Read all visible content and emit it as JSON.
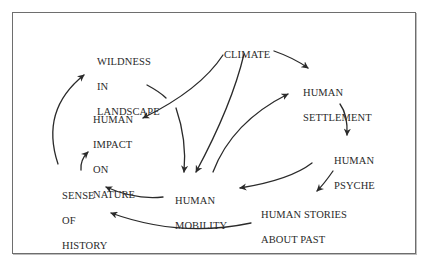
{
  "diagram": {
    "nodes": {
      "climate": {
        "lines": [
          "CLIMATE"
        ]
      },
      "wildness": {
        "lines": [
          "WILDNESS",
          "IN",
          "LANDSCAPE"
        ]
      },
      "settlement": {
        "lines": [
          "HUMAN",
          "SETTLEMENT"
        ]
      },
      "impact": {
        "lines": [
          "HUMAN",
          "IMPACT",
          "ON",
          "NATURE"
        ]
      },
      "psyche": {
        "lines": [
          "HUMAN",
          "PSYCHE"
        ]
      },
      "history": {
        "lines": [
          "SENSE",
          "OF",
          "HISTORY"
        ]
      },
      "mobility": {
        "lines": [
          "HUMAN",
          "MOBILITY"
        ]
      },
      "stories": {
        "lines": [
          "HUMAN STORIES",
          "ABOUT PAST"
        ]
      }
    },
    "edges": [
      {
        "from": "CLIMATE",
        "to": "HUMAN SETTLEMENT"
      },
      {
        "from": "CLIMATE",
        "to": "HUMAN IMPACT ON NATURE"
      },
      {
        "from": "CLIMATE",
        "to": "HUMAN MOBILITY"
      },
      {
        "from": "HUMAN MOBILITY",
        "to": "HUMAN SETTLEMENT"
      },
      {
        "from": "WILDNESS IN LANDSCAPE",
        "to": "HUMAN MOBILITY"
      },
      {
        "from": "HUMAN SETTLEMENT",
        "to": "HUMAN PSYCHE"
      },
      {
        "from": "HUMAN PSYCHE",
        "to": "HUMAN MOBILITY"
      },
      {
        "from": "HUMAN PSYCHE",
        "to": "HUMAN STORIES ABOUT PAST"
      },
      {
        "from": "HUMAN MOBILITY",
        "to": "SENSE OF HISTORY"
      },
      {
        "from": "HUMAN STORIES ABOUT PAST",
        "to": "SENSE OF HISTORY"
      },
      {
        "from": "SENSE OF HISTORY",
        "to": "WILDNESS IN LANDSCAPE"
      },
      {
        "from": "SENSE OF HISTORY",
        "to": "HUMAN IMPACT ON NATURE"
      }
    ],
    "colors": {
      "ink": "#2a2a2a",
      "frame": "#6e6e6e",
      "background": "#ffffff"
    }
  }
}
